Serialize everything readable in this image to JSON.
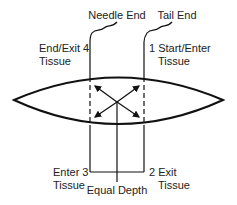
{
  "diagram": {
    "labels": {
      "needle_end": "Needle End",
      "tail_end": "Tail End",
      "end_exit_4": "End/Exit 4",
      "end_exit_4_tissue": "Tissue",
      "start_enter_1": "1 Start/Enter",
      "start_enter_1_tissue": "Tissue",
      "enter_3": "Enter 3",
      "enter_3_tissue": "Tissue",
      "exit_2": "2 Exit",
      "exit_2_tissue": "Tissue",
      "equal_depth": "Equal Depth"
    },
    "colors": {
      "line": "#111111",
      "background": "#ffffff"
    }
  }
}
